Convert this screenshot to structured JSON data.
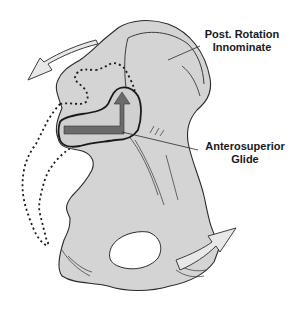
{
  "figure": {
    "colors": {
      "bone_fill": "#d4d4d4",
      "outline": "#2a2a2a",
      "glide_arrow": "#6b6b6b",
      "rotation_arrow_fill": "#e8e8e8",
      "background": "#ffffff"
    }
  },
  "labels": {
    "posterior_rotation": {
      "line1": "Post. Rotation",
      "line2": "Innominate"
    },
    "anterosuperior_glide": {
      "line1": "Anterosuperior",
      "line2": "Glide"
    }
  },
  "icons": {
    "rotation_arrow_upper": "curved-arrow-left",
    "rotation_arrow_lower": "curved-arrow-right",
    "glide_arrow": "l-shaped-arrow-up"
  }
}
